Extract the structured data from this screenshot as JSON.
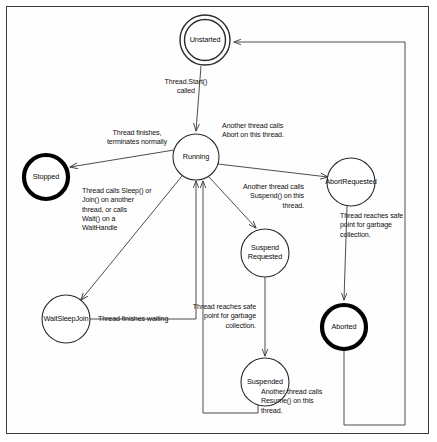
{
  "diagram": {
    "type": "state-machine",
    "colors": {
      "line": "#3a3a3a",
      "text": "#111111",
      "node_stroke": "#2b2b2b",
      "terminal_stroke": "#000000",
      "background": "#ffffff",
      "frame": "#3a3a3a"
    },
    "nodes": [
      {
        "id": "unstarted",
        "label": "Unstarted",
        "shape": "double-circle",
        "cx": 205,
        "cy": 40,
        "r": 25
      },
      {
        "id": "running",
        "label": "Running",
        "shape": "circle",
        "cx": 196,
        "cy": 157,
        "r": 23
      },
      {
        "id": "stopped",
        "label": "Stopped",
        "shape": "thick-circle",
        "cx": 46,
        "cy": 177,
        "r": 23
      },
      {
        "id": "abortrequested",
        "label": "AbortRequested",
        "shape": "circle",
        "cx": 351,
        "cy": 182,
        "r": 24
      },
      {
        "id": "suspendrequested",
        "label": "Suspend\nRequested",
        "shape": "circle",
        "cx": 265,
        "cy": 253,
        "r": 24
      },
      {
        "id": "waitsleepjoin",
        "label": "WaitSleepJoin",
        "shape": "circle",
        "cx": 66,
        "cy": 319,
        "r": 24
      },
      {
        "id": "aborted",
        "label": "Aborted",
        "shape": "thick-circle",
        "cx": 344,
        "cy": 327,
        "r": 24
      },
      {
        "id": "suspended",
        "label": "Suspended",
        "shape": "circle",
        "cx": 265,
        "cy": 382,
        "r": 24
      }
    ],
    "edges": [
      {
        "id": "start",
        "from": "unstarted",
        "to": "running",
        "label": "Thread.Start()\ncalled"
      },
      {
        "id": "terminate",
        "from": "running",
        "to": "stopped",
        "label": "Thread finishes,\nterminates normally"
      },
      {
        "id": "abort",
        "from": "running",
        "to": "abortrequested",
        "label": "Another thread calls\nAbort on this thread."
      },
      {
        "id": "suspend",
        "from": "running",
        "to": "suspendrequested",
        "label": "Another thread calls\nSuspend() on this\nthread."
      },
      {
        "id": "wait",
        "from": "running",
        "to": "waitsleepjoin",
        "label": "Thread calls Sleep() or\nJoin() on another\nthread, or calls\nWait() on a\nWaitHandle"
      },
      {
        "id": "abort-gc",
        "from": "abortrequested",
        "to": "aborted",
        "label": "Thread reaches safe\npoint for garbage\ncollection."
      },
      {
        "id": "suspend-gc",
        "from": "suspendrequested",
        "to": "suspended",
        "label": "Thread reaches safe\npoint for garbage\ncollection."
      },
      {
        "id": "finish-waiting",
        "from": "waitsleepjoin",
        "to": "running",
        "label": "Thread finishes waiting"
      },
      {
        "id": "resume",
        "from": "suspended",
        "to": "running",
        "label": "Another thread calls\nResume() on this\nthread."
      },
      {
        "id": "restart",
        "from": "aborted",
        "to": "unstarted",
        "label": ""
      }
    ],
    "labels": {
      "start": {
        "text": "Thread.Start()\ncalled",
        "x": 151,
        "y": 78,
        "w": 70,
        "align": "ctr"
      },
      "terminate": {
        "text": "Thread finishes,\nterminates normally",
        "x": 96,
        "y": 129,
        "w": 82,
        "align": "ctr"
      },
      "abort": {
        "text": "Another thread calls\nAbort on this thread.",
        "x": 222,
        "y": 122,
        "w": 78,
        "align": "lft"
      },
      "suspend": {
        "text": "Another thread calls\nSuspend() on this\nthread.",
        "x": 224,
        "y": 183,
        "w": 80,
        "align": "rgt"
      },
      "wait": {
        "text": "Thread calls Sleep() or\nJoin() on another\nthread, or calls\nWait() on a\nWaitHandle",
        "x": 82,
        "y": 187,
        "w": 92,
        "align": "lft"
      },
      "abort-gc": {
        "text": "Thread reaches safe\npoint for garbage\ncollection.",
        "x": 340,
        "y": 212,
        "w": 80,
        "align": "lft"
      },
      "suspend-gc": {
        "text": "Thread reaches safe\npoint for garbage\ncollection.",
        "x": 176,
        "y": 303,
        "w": 80,
        "align": "rgt"
      },
      "finish-waiting": {
        "text": "Thread finishes waiting",
        "x": 98,
        "y": 315,
        "w": 96,
        "align": "lft"
      },
      "resume": {
        "text": "Another thread calls\nResume() on this\nthread.",
        "x": 261,
        "y": 388,
        "w": 80,
        "align": "lft"
      }
    }
  }
}
